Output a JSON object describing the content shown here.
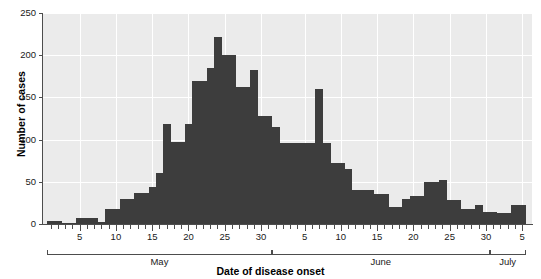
{
  "chart_data": {
    "type": "bar",
    "title": "",
    "subtitle": "",
    "xlabel": "Date of disease onset",
    "ylabel": "Number of cases",
    "ylim": [
      0,
      250
    ],
    "yticks": [
      0,
      50,
      100,
      150,
      200,
      250
    ],
    "ytick_labels": [
      "0",
      "50",
      "100",
      "150",
      "200",
      "250"
    ],
    "grid": true,
    "legend": null,
    "bar_color": "#3d3d3d",
    "plot_background": "#ebebeb",
    "gridline_color": "#ffffff",
    "axis_color": "#4d4d4d",
    "x_axis_type": "date",
    "x_start": "May 1",
    "x_end": "July 5",
    "xtick_labels": [
      "5",
      "10",
      "15",
      "20",
      "25",
      "30",
      "5",
      "10",
      "15",
      "20",
      "25",
      "30",
      "5"
    ],
    "month_brackets": [
      {
        "label": "May",
        "start_day": 1,
        "end_day": 31
      },
      {
        "label": "June",
        "start_day": 32,
        "end_day": 61
      },
      {
        "label": "July",
        "start_day": 62,
        "end_day": 66
      }
    ],
    "categories": [
      "May 1",
      "May 2",
      "May 3",
      "May 4",
      "May 5",
      "May 6",
      "May 7",
      "May 8",
      "May 9",
      "May 10",
      "May 11",
      "May 12",
      "May 13",
      "May 14",
      "May 15",
      "May 16",
      "May 17",
      "May 18",
      "May 19",
      "May 20",
      "May 21",
      "May 22",
      "May 23",
      "May 24",
      "May 25",
      "May 26",
      "May 27",
      "May 28",
      "May 29",
      "May 30",
      "May 31",
      "Jun 1",
      "Jun 2",
      "Jun 3",
      "Jun 4",
      "Jun 5",
      "Jun 6",
      "Jun 7",
      "Jun 8",
      "Jun 9",
      "Jun 10",
      "Jun 11",
      "Jun 12",
      "Jun 13",
      "Jun 14",
      "Jun 15",
      "Jun 16",
      "Jun 17",
      "Jun 18",
      "Jun 19",
      "Jun 20",
      "Jun 21",
      "Jun 22",
      "Jun 23",
      "Jun 24",
      "Jun 25",
      "Jun 26",
      "Jun 27",
      "Jun 28",
      "Jun 29",
      "Jun 30",
      "Jul 1",
      "Jul 2",
      "Jul 3",
      "Jul 4",
      "Jul 5"
    ],
    "values": [
      3,
      3,
      1,
      1,
      7,
      7,
      7,
      2,
      18,
      18,
      30,
      30,
      37,
      37,
      44,
      60,
      118,
      97,
      97,
      118,
      170,
      170,
      185,
      222,
      200,
      200,
      162,
      162,
      182,
      128,
      128,
      115,
      96,
      96,
      96,
      96,
      96,
      160,
      96,
      72,
      72,
      65,
      40,
      40,
      40,
      36,
      36,
      20,
      20,
      30,
      33,
      33,
      50,
      50,
      52,
      28,
      28,
      18,
      18,
      22,
      14,
      14,
      13,
      13,
      22,
      22
    ]
  }
}
